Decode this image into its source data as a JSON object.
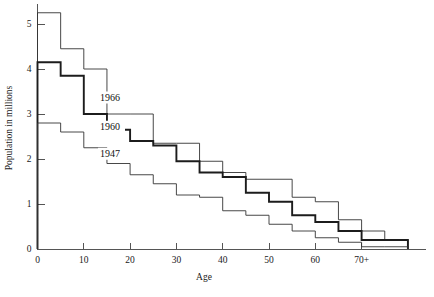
{
  "chart_data": {
    "type": "line",
    "title": "",
    "subtitle": "",
    "xlabel": "Age",
    "ylabel": "Population in millions",
    "xlim": [
      0,
      77.5
    ],
    "ylim": [
      0,
      5.5
    ],
    "grid": false,
    "legend_position": "inline-annotations",
    "x_tick_labels": [
      "0",
      "10",
      "20",
      "30",
      "40",
      "50",
      "60",
      "70+"
    ],
    "x_tick_values": [
      0,
      10,
      20,
      30,
      40,
      50,
      60,
      70
    ],
    "y_tick_labels": [
      "0",
      "1",
      "2",
      "3",
      "4",
      "5"
    ],
    "y_tick_values": [
      0,
      1,
      2,
      3,
      4,
      5
    ],
    "step_type": "post",
    "band_width": 5,
    "categories": [
      0,
      5,
      10,
      15,
      20,
      25,
      30,
      35,
      40,
      45,
      50,
      55,
      60,
      65,
      70,
      75
    ],
    "series": [
      {
        "name": "1966",
        "style": "thin",
        "label_x": 13.5,
        "label_y": 3.3,
        "values": [
          5.25,
          4.45,
          4.0,
          3.0,
          3.0,
          2.35,
          2.35,
          1.95,
          1.7,
          1.55,
          1.55,
          1.15,
          1.05,
          0.65,
          0.4,
          0.2
        ]
      },
      {
        "name": "1960",
        "style": "bold",
        "label_x": 13.5,
        "label_y": 2.65,
        "values": [
          4.15,
          3.85,
          3.0,
          2.65,
          2.4,
          2.3,
          1.95,
          1.7,
          1.6,
          1.25,
          1.05,
          0.75,
          0.6,
          0.4,
          0.2,
          0.2
        ]
      },
      {
        "name": "1947",
        "style": "thin",
        "label_x": 13.5,
        "label_y": 2.05,
        "values": [
          2.8,
          2.6,
          2.25,
          1.9,
          1.65,
          1.45,
          1.2,
          1.15,
          0.85,
          0.75,
          0.55,
          0.4,
          0.25,
          0.15,
          0.05,
          0.05
        ]
      }
    ]
  },
  "axes": {
    "y_axis_title": "Population in millions",
    "x_axis_title": "Age"
  },
  "annotations": [
    {
      "text": "1966"
    },
    {
      "text": "1960"
    },
    {
      "text": "1947"
    }
  ]
}
